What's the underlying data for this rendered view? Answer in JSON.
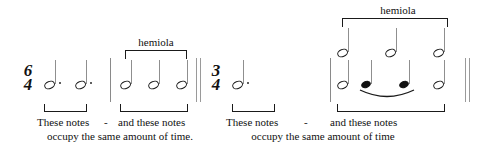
{
  "figure": {
    "ink_color": "#111111",
    "stave_line_color": "#8f8f8f",
    "background": "#ffffff"
  },
  "labels": {
    "hemiola_left": "hemiola",
    "hemiola_right": "hemiola"
  },
  "time_signatures": {
    "left": {
      "numerator": "6",
      "denominator": "4"
    },
    "right": {
      "numerator": "3",
      "denominator": "4"
    }
  },
  "captions": {
    "left": {
      "phrase_a": "These notes",
      "dash": "-",
      "phrase_b": "and these notes",
      "phrase_c": "occupy the same amount of time."
    },
    "right": {
      "phrase_a": "These notes",
      "dash": "-",
      "phrase_b": "and these notes",
      "phrase_c": "occupy the same amount of time"
    }
  },
  "measures": [
    {
      "name": "measure-6-4",
      "time_signature": "6/4",
      "groups": [
        {
          "name": "group-dotted-half-notes",
          "bracketed": "bottom",
          "notes": [
            {
              "duration": "dotted-half",
              "dotted": true,
              "filled": false
            },
            {
              "duration": "dotted-half",
              "dotted": true,
              "filled": false
            }
          ]
        },
        {
          "name": "group-hemiola-half-notes",
          "bracketed": "top-and-bottom",
          "label": "hemiola",
          "notes": [
            {
              "duration": "half",
              "dotted": false,
              "filled": false
            },
            {
              "duration": "half",
              "dotted": false,
              "filled": false
            },
            {
              "duration": "half",
              "dotted": false,
              "filled": false
            }
          ]
        }
      ]
    },
    {
      "name": "measure-3-4",
      "time_signature": "3/4",
      "groups": [
        {
          "name": "group-dotted-half-note",
          "bracketed": "bottom",
          "notes": [
            {
              "duration": "dotted-half",
              "dotted": true,
              "filled": false
            }
          ]
        },
        {
          "name": "group-hemiola-two-voice",
          "bracketed": "top-and-bottom",
          "label": "hemiola",
          "upper_voice": [
            {
              "duration": "half",
              "dotted": false,
              "filled": false
            },
            {
              "duration": "half",
              "dotted": false,
              "filled": false
            },
            {
              "duration": "half",
              "dotted": false,
              "filled": false
            }
          ],
          "lower_voice": [
            {
              "duration": "half",
              "dotted": false,
              "filled": false
            },
            {
              "duration": "quarter",
              "dotted": false,
              "filled": true,
              "slurred": true
            },
            {
              "duration": "quarter",
              "dotted": false,
              "filled": true,
              "slurred": true
            },
            {
              "duration": "half",
              "dotted": false,
              "filled": false
            }
          ]
        }
      ]
    }
  ],
  "barlines": [
    {
      "name": "barline-before-left-hemiola",
      "type": "single"
    },
    {
      "name": "barline-double-midpoint",
      "type": "double"
    },
    {
      "name": "barline-before-right-hemiola",
      "type": "single"
    },
    {
      "name": "barline-final-double",
      "type": "double"
    }
  ]
}
